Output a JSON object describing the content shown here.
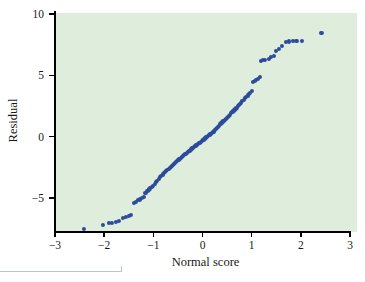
{
  "figure": {
    "kind": "normal-probability-plot",
    "panel_background": "#dfeddd",
    "point_color": "#2c4b9b",
    "axis_color": "#000000"
  },
  "chart_data": {
    "type": "scatter",
    "title": "",
    "subtitle": "",
    "xlabel": "Normal score",
    "ylabel": "Residual",
    "xlim": [
      -3,
      3
    ],
    "ylim": [
      -8.6,
      10.6
    ],
    "xticks": [
      -3,
      -2,
      -1,
      0,
      1,
      2,
      3
    ],
    "xticklabels": [
      "−3",
      "−2",
      "−1",
      "0",
      "1",
      "2",
      "3"
    ],
    "yticks": [
      10,
      5,
      0,
      -5
    ],
    "yticklabels": [
      "10",
      "5",
      "0",
      "−5"
    ],
    "grid": false,
    "legend": null,
    "series": [
      {
        "name": "Residuals vs normal scores",
        "marker": "filled-circle",
        "color": "#2c4b9b",
        "x": [
          -2.42,
          -2.03,
          -1.91,
          -1.84,
          -1.76,
          -1.7,
          -1.61,
          -1.55,
          -1.5,
          -1.46,
          -1.4,
          -1.35,
          -1.31,
          -1.27,
          -1.23,
          -1.19,
          -1.16,
          -1.12,
          -1.09,
          -1.06,
          -1.03,
          -1.0,
          -0.97,
          -0.94,
          -0.92,
          -0.89,
          -0.86,
          -0.84,
          -0.81,
          -0.79,
          -0.76,
          -0.74,
          -0.72,
          -0.69,
          -0.67,
          -0.65,
          -0.63,
          -0.61,
          -0.58,
          -0.56,
          -0.54,
          -0.52,
          -0.5,
          -0.48,
          -0.46,
          -0.44,
          -0.42,
          -0.4,
          -0.38,
          -0.36,
          -0.34,
          -0.32,
          -0.3,
          -0.28,
          -0.26,
          -0.24,
          -0.23,
          -0.21,
          -0.19,
          -0.17,
          -0.15,
          -0.13,
          -0.11,
          -0.09,
          -0.07,
          -0.06,
          -0.04,
          -0.02,
          0.0,
          0.02,
          0.04,
          0.06,
          0.07,
          0.09,
          0.11,
          0.13,
          0.15,
          0.17,
          0.19,
          0.21,
          0.23,
          0.24,
          0.26,
          0.28,
          0.3,
          0.32,
          0.34,
          0.36,
          0.38,
          0.4,
          0.42,
          0.44,
          0.46,
          0.48,
          0.5,
          0.52,
          0.54,
          0.56,
          0.58,
          0.61,
          0.63,
          0.65,
          0.67,
          0.69,
          0.72,
          0.74,
          0.76,
          0.79,
          0.81,
          0.84,
          0.86,
          0.89,
          0.92,
          0.94,
          0.97,
          1.0,
          1.03,
          1.06,
          1.09,
          1.12,
          1.16,
          1.19,
          1.23,
          1.27,
          1.35,
          1.4,
          1.46,
          1.5,
          1.55,
          1.61,
          1.7,
          1.76,
          1.84,
          1.91,
          2.03,
          2.42
        ],
        "y": [
          -7.55,
          -7.22,
          -7.05,
          -7.02,
          -6.92,
          -6.88,
          -6.6,
          -6.52,
          -6.45,
          -6.4,
          -5.42,
          -5.3,
          -5.18,
          -5.12,
          -4.98,
          -4.9,
          -4.62,
          -4.4,
          -4.3,
          -4.22,
          -4.12,
          -4.02,
          -3.88,
          -3.72,
          -3.58,
          -3.42,
          -3.3,
          -3.18,
          -3.08,
          -2.98,
          -2.88,
          -2.8,
          -2.72,
          -2.62,
          -2.52,
          -2.44,
          -2.38,
          -2.3,
          -2.22,
          -2.14,
          -2.06,
          -1.98,
          -1.92,
          -1.86,
          -1.78,
          -1.7,
          -1.62,
          -1.56,
          -1.5,
          -1.44,
          -1.38,
          -1.32,
          -1.26,
          -1.2,
          -1.14,
          -1.08,
          -1.02,
          -0.96,
          -0.9,
          -0.84,
          -0.78,
          -0.72,
          -0.66,
          -0.6,
          -0.54,
          -0.48,
          -0.42,
          -0.36,
          -0.3,
          -0.24,
          -0.18,
          -0.12,
          -0.06,
          0.0,
          0.06,
          0.12,
          0.18,
          0.24,
          0.3,
          0.36,
          0.42,
          0.48,
          0.54,
          0.62,
          0.7,
          0.8,
          0.9,
          1.0,
          1.08,
          1.16,
          1.24,
          1.3,
          1.38,
          1.46,
          1.54,
          1.62,
          1.7,
          1.8,
          1.9,
          2.0,
          2.1,
          2.16,
          2.24,
          2.34,
          2.48,
          2.58,
          2.68,
          2.78,
          2.9,
          3.0,
          3.12,
          3.24,
          3.36,
          3.48,
          3.6,
          3.7,
          4.48,
          4.56,
          4.62,
          4.72,
          4.86,
          6.18,
          6.22,
          6.26,
          6.34,
          6.52,
          6.56,
          7.0,
          7.18,
          7.42,
          7.72,
          7.76,
          7.78,
          7.8,
          7.82,
          8.46
        ]
      }
    ]
  }
}
